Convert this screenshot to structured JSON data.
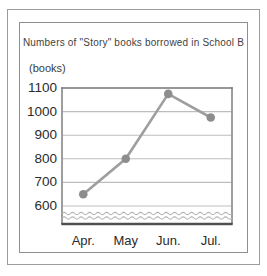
{
  "chart_data": {
    "type": "line",
    "title": "Numbers of \"Story\" books borrowed in School B",
    "unit_label": "(books)",
    "categories": [
      "Apr.",
      "May",
      "Jun.",
      "Jul."
    ],
    "values": [
      650,
      800,
      1075,
      975
    ],
    "yticks": [
      1100,
      1000,
      900,
      800,
      700,
      600
    ],
    "ylim": [
      600,
      1100
    ],
    "grid": true,
    "legend": false,
    "axis_break": true,
    "colors": {
      "line": "#9e9e9e",
      "marker": "#8d8d8d",
      "grid": "#bdbdbd",
      "plot_border": "#757575",
      "baseline": "#4f4f4f",
      "break_wave": "#b5b5b5",
      "text": "#2b2b2b",
      "card_border": "#8f8f8f",
      "outer_border": "#9c9c9c",
      "background": "#ffffff"
    }
  }
}
